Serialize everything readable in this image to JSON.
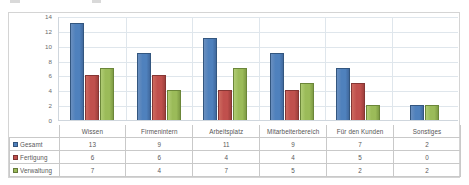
{
  "chart_data": {
    "type": "bar",
    "title": "",
    "subtitle": "",
    "xlabel": "",
    "ylabel": "",
    "ylim": [
      0,
      14
    ],
    "ytick_step": 2,
    "yticks": [
      14,
      12,
      10,
      8,
      6,
      4,
      2,
      0
    ],
    "grid": true,
    "legend_position": "data-table",
    "show_data_table": true,
    "categories": [
      "Wissen",
      "Firmenintern",
      "Arbeitsplatz",
      "Mitarbeiterbereich",
      "Für den Kunden",
      "Sonstiges"
    ],
    "series": [
      {
        "name": "Gesamt",
        "color": "#4f81bd",
        "values": [
          13,
          9,
          11,
          9,
          7,
          2
        ]
      },
      {
        "name": "Fertigung",
        "color": "#c0504d",
        "values": [
          6,
          6,
          4,
          4,
          5,
          0
        ]
      },
      {
        "name": "Verwaltung",
        "color": "#9bbb59",
        "values": [
          7,
          4,
          7,
          5,
          2,
          2
        ]
      }
    ]
  },
  "table": {
    "row_labels": [
      "Gesamt",
      "Fertigung",
      "Verwaltung"
    ],
    "rows": [
      [
        "13",
        "9",
        "11",
        "9",
        "7",
        "2"
      ],
      [
        "6",
        "6",
        "4",
        "4",
        "5",
        "0"
      ],
      [
        "7",
        "4",
        "7",
        "5",
        "2",
        "2"
      ]
    ]
  },
  "colors": {
    "series_gesamt": "#4f81bd",
    "series_fertigung": "#c0504d",
    "series_verwaltung": "#9bbb59",
    "gridline": "#dfe6ec",
    "frame_border": "#d4d4d4",
    "table_border": "#c9c9c9",
    "text": "#595959"
  }
}
